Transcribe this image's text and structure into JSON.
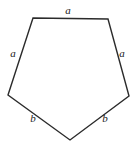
{
  "figure": {
    "name": "irregular-pentagon-diagram",
    "background_color": "#ffffff",
    "stroke_color": "#2b2b2b",
    "stroke_width": 1.4,
    "fill_color": "none",
    "label_color": "#1a1a1a",
    "label_font_style": "italic",
    "label_font_size": 11,
    "vertices": [
      {
        "name": "top-left",
        "x": 33,
        "y": 18
      },
      {
        "name": "top-right",
        "x": 108,
        "y": 19
      },
      {
        "name": "right",
        "x": 129,
        "y": 96
      },
      {
        "name": "bottom",
        "x": 70,
        "y": 140
      },
      {
        "name": "left",
        "x": 8,
        "y": 95
      }
    ],
    "sides": [
      {
        "name": "top-side",
        "label": "a",
        "label_x": 68,
        "label_y": 10
      },
      {
        "name": "upper-left-side",
        "label": "a",
        "label_x": 13,
        "label_y": 53
      },
      {
        "name": "upper-right-side",
        "label": "a",
        "label_x": 122,
        "label_y": 53
      },
      {
        "name": "lower-left-side",
        "label": "b",
        "label_x": 33,
        "label_y": 118
      },
      {
        "name": "lower-right-side",
        "label": "b",
        "label_x": 105,
        "label_y": 118
      }
    ]
  }
}
